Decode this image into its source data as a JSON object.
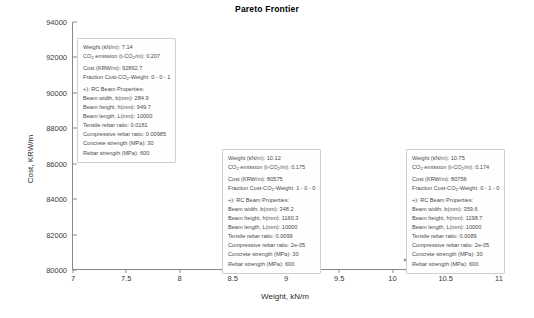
{
  "chart_data": {
    "type": "scatter",
    "title": "Pareto Frontier",
    "xlabel": "Weight, kN/m",
    "ylabel": "Cost, KRW/m",
    "xlim": [
      7,
      11
    ],
    "ylim": [
      80000,
      94000
    ],
    "xticks": [
      "7",
      "7.5",
      "8",
      "8.5",
      "9",
      "9.5",
      "10",
      "10.5",
      "11"
    ],
    "yticks": [
      "80000",
      "82000",
      "84000",
      "86000",
      "88000",
      "90000",
      "92000",
      "94000"
    ],
    "grid": false,
    "legend": null,
    "marker_color": "#9aa0b4",
    "x": [
      7.14,
      10.12,
      10.75
    ],
    "y": [
      92862.7,
      80575,
      80756
    ],
    "points": [
      {
        "name": "pareto-point-1",
        "x": 7.14,
        "y": 92862.7
      },
      {
        "name": "pareto-point-2",
        "x": 10.12,
        "y": 80575
      },
      {
        "name": "pareto-point-3",
        "x": 10.75,
        "y": 80756
      }
    ]
  },
  "datatips": [
    {
      "weight_label": "Weight (kN/m): ",
      "weight_value": "7.14",
      "co2_label_a": "CO",
      "co2_label_b": " emission (t-CO",
      "co2_label_c": "/m): ",
      "co2_value": "0.207",
      "cost_label": "Cost (KRW/m): ",
      "cost_value": "92862.7",
      "fraction_label_a": "Fraction Cost-CO",
      "fraction_label_b": "-Weight: ",
      "fraction_value": "0 - 0 - 1",
      "props_header": "+): RC Beam Properties:",
      "width_label": "Beam width, b(mm): ",
      "width_value": "284.9",
      "height_label": "Beam height, h(mm): ",
      "height_value": "949.7",
      "length_label": "Beam length, L(mm): ",
      "length_value": "10000",
      "tensile_label": "Tensile rebar ratio: ",
      "tensile_value": "0.0181",
      "compressive_label": "Compressive rebar ratio: ",
      "compressive_value": "0.00985",
      "concrete_label": "Concrete strength (MPa): ",
      "concrete_value": "30",
      "rebar_label": "Rebar strength (MPa): ",
      "rebar_value": "600"
    },
    {
      "weight_label": "Weight (kN/m): ",
      "weight_value": "10.12",
      "co2_label_a": "CO",
      "co2_label_b": " emission (t-CO",
      "co2_label_c": "/m): ",
      "co2_value": "0.175",
      "cost_label": "Cost (KRW/m): ",
      "cost_value": "80575",
      "fraction_label_a": "Fraction Cost-CO",
      "fraction_label_b": "-Weight: ",
      "fraction_value": "1 - 0 - 0",
      "props_header": "+): RC Beam Properties:",
      "width_label": "Beam width, b(mm): ",
      "width_value": "348.2",
      "height_label": "Beam height, h(mm): ",
      "height_value": "1160.3",
      "length_label": "Beam length, L(mm): ",
      "length_value": "10000",
      "tensile_label": "Tensile rebar ratio: ",
      "tensile_value": "0.0099",
      "compressive_label": "Compressive rebar ratio: ",
      "compressive_value": "2e-05",
      "concrete_label": "Concrete strength (MPa): ",
      "concrete_value": "30",
      "rebar_label": "Rebar strength (MPa): ",
      "rebar_value": "600"
    },
    {
      "weight_label": "Weight (kN/m): ",
      "weight_value": "10.75",
      "co2_label_a": "CO",
      "co2_label_b": " emission (t-CO",
      "co2_label_c": "/m): ",
      "co2_value": "0.174",
      "cost_label": "Cost (KRW/m): ",
      "cost_value": "80756",
      "fraction_label_a": "Fraction Cost-CO",
      "fraction_label_b": "-Weight: ",
      "fraction_value": "0 - 1 - 0",
      "props_header": "+): RC Beam Properties:",
      "width_label": "Beam width, b(mm): ",
      "width_value": "359.6",
      "height_label": "Beam height, h(mm): ",
      "height_value": "1198.7",
      "length_label": "Beam length, L(mm): ",
      "length_value": "10000",
      "tensile_label": "Tensile rebar ratio: ",
      "tensile_value": "0.0089",
      "compressive_label": "Compressive rebar ratio: ",
      "compressive_value": "2e-05",
      "concrete_label": "Concrete strength (MPa): ",
      "concrete_value": "30",
      "rebar_label": "Rebar strength (MPa): ",
      "rebar_value": "600"
    }
  ]
}
